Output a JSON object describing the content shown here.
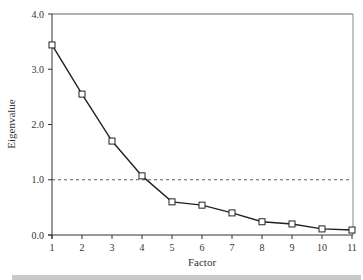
{
  "chart_data": {
    "type": "line",
    "title": "",
    "xlabel": "Factor",
    "ylabel": "Eigenvalue",
    "x": [
      1,
      2,
      3,
      4,
      5,
      6,
      7,
      8,
      9,
      10,
      11
    ],
    "series": [
      {
        "name": "Eigenvalue",
        "values": [
          3.44,
          2.55,
          1.7,
          1.07,
          0.6,
          0.54,
          0.4,
          0.24,
          0.2,
          0.11,
          0.09
        ],
        "marker": "square"
      }
    ],
    "reference_line": {
      "y": 1.0,
      "style": "dashed"
    },
    "xticks": [
      "1",
      "2",
      "3",
      "4",
      "5",
      "6",
      "7",
      "8",
      "9",
      "10",
      "11"
    ],
    "yticks": [
      "0.0",
      "1.0",
      "2.0",
      "3.0",
      "4.0"
    ],
    "ylim": [
      0,
      4.0
    ],
    "xlim": [
      1,
      11
    ],
    "grid": false,
    "legend": null
  },
  "colors": {
    "line": "#222222",
    "axis": "#333333",
    "bar": "#c9c9c9"
  }
}
